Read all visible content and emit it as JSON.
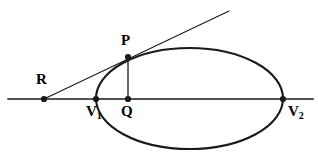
{
  "figure": {
    "background_color": "#ffffff",
    "stroke_color": "#1a1a1a",
    "width": 318,
    "height": 154
  },
  "labels": {
    "R": "R",
    "P": "P",
    "Q": "Q",
    "V1_base": "V",
    "V1_sub": "1",
    "V2_base": "V",
    "V2_sub": "2"
  },
  "chart_data": {
    "type": "scatter",
    "xlabel": "",
    "ylabel": "",
    "grid": false,
    "legend": "none",
    "xlim": [
      0,
      318
    ],
    "ylim": [
      154,
      0
    ],
    "shapes": [
      {
        "name": "ellipse",
        "type": "ellipse",
        "cx": 189.5,
        "cy": 98.5,
        "rx": 93.5,
        "ry": 50.5,
        "stroke_width": 2.1
      },
      {
        "name": "major-axis-line",
        "type": "line",
        "x1": 8,
        "y1": 99,
        "x2": 313,
        "y2": 99,
        "stroke_width": 1.5
      },
      {
        "name": "tangent-line",
        "type": "line",
        "x1": 44,
        "y1": 99,
        "x2": 229,
        "y2": 11,
        "stroke_width": 1.1
      },
      {
        "name": "perpendicular-segment-PQ",
        "type": "line",
        "x1": 128,
        "y1": 57,
        "x2": 128,
        "y2": 99,
        "stroke_width": 1.3
      }
    ],
    "points": [
      {
        "name": "R",
        "label": "R",
        "x": 44,
        "y": 99,
        "marker": "filled-circle",
        "radius": 3.1
      },
      {
        "name": "P",
        "label": "P",
        "x": 128,
        "y": 57,
        "marker": "filled-circle",
        "radius": 3.1
      },
      {
        "name": "Q",
        "label": "Q",
        "x": 128,
        "y": 99,
        "marker": "filled-circle",
        "radius": 3.1
      },
      {
        "name": "V1",
        "label": "V1",
        "x": 96,
        "y": 99,
        "marker": "filled-circle",
        "radius": 3.1
      },
      {
        "name": "V2",
        "label": "V2",
        "x": 283,
        "y": 99,
        "marker": "filled-circle",
        "radius": 3.1
      }
    ]
  }
}
